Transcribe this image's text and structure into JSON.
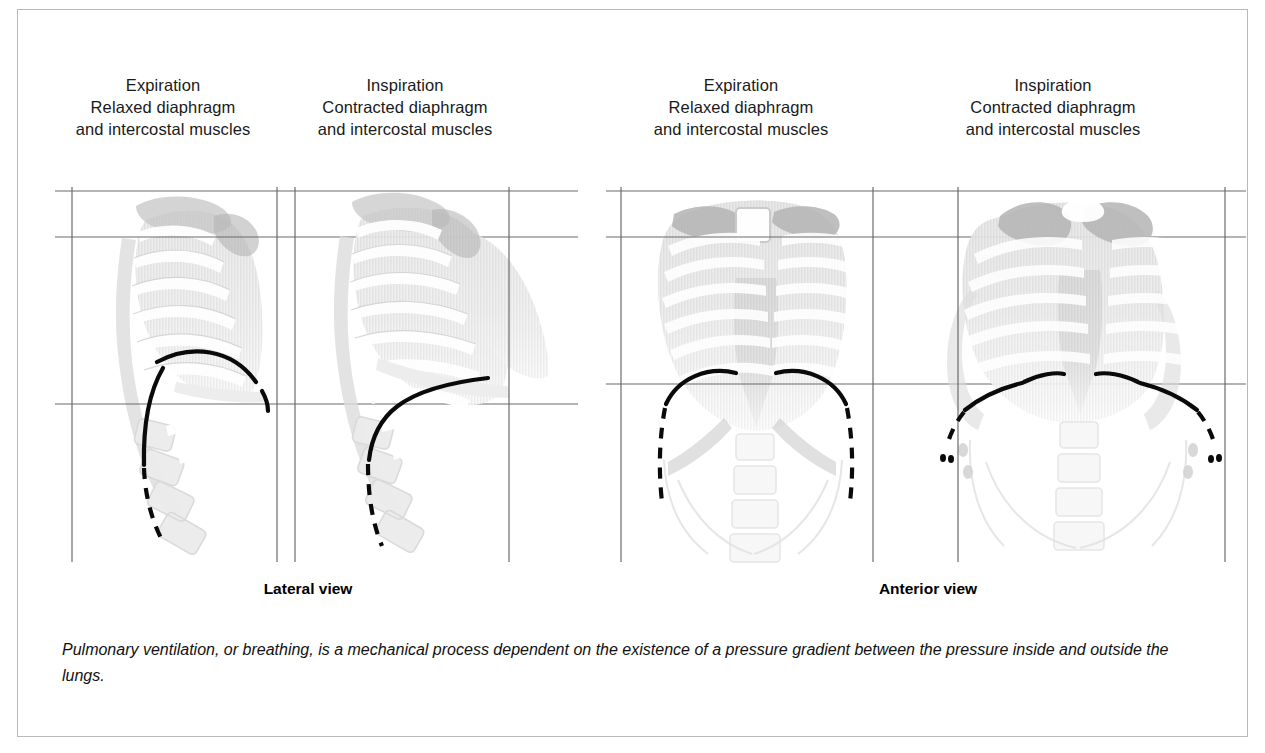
{
  "figure": {
    "border_color": "#b9b9b9",
    "background": "#ffffff"
  },
  "panels": [
    {
      "id": "lateral-expiration",
      "view": "Lateral view",
      "phase": "Expiration",
      "heading_lines": [
        "Expiration",
        "Relaxed diaphragm",
        "and intercostal muscles"
      ],
      "diaphragm_state": "relaxed-domed"
    },
    {
      "id": "lateral-inspiration",
      "view": "Lateral view",
      "phase": "Inspiration",
      "heading_lines": [
        "Inspiration",
        "Contracted diaphragm",
        "and intercostal muscles"
      ],
      "diaphragm_state": "contracted-flattened"
    },
    {
      "id": "anterior-expiration",
      "view": "Anterior view",
      "phase": "Expiration",
      "heading_lines": [
        "Expiration",
        "Relaxed diaphragm",
        "and intercostal muscles"
      ],
      "diaphragm_state": "relaxed-domed"
    },
    {
      "id": "anterior-inspiration",
      "view": "Inspiration",
      "phase": "Inspiration",
      "heading_lines": [
        "Inspiration",
        "Contracted diaphragm",
        "and intercostal muscles"
      ],
      "diaphragm_state": "contracted-flattened"
    }
  ],
  "headings": {
    "lateral_expiration": {
      "line1": "Expiration",
      "line2": "Relaxed diaphragm",
      "line3": "and intercostal muscles"
    },
    "lateral_inspiration": {
      "line1": "Inspiration",
      "line2": "Contracted diaphragm",
      "line3": "and intercostal muscles"
    },
    "anterior_expiration": {
      "line1": "Expiration",
      "line2": "Relaxed diaphragm",
      "line3": "and intercostal muscles"
    },
    "anterior_inspiration": {
      "line1": "Inspiration",
      "line2": "Contracted diaphragm",
      "line3": "and intercostal muscles"
    }
  },
  "view_captions": {
    "lateral": "Lateral view",
    "anterior": "Anterior view"
  },
  "caption": {
    "text": "Pulmonary ventilation, or breathing, is a mechanical process dependent on the existence of a pressure gradient between the pressure inside and outside the lungs."
  },
  "colors": {
    "ruler": "#6b6b6b",
    "diaphragm": "#0a0a0a",
    "bone_light": "#ececec",
    "bone_mid": "#dcdcdc",
    "bone_dark": "#c6c6c6",
    "text": "#1a1a1a"
  }
}
